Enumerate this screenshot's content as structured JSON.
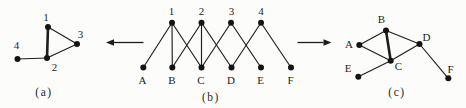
{
  "figure": {
    "width": 466,
    "height": 108,
    "background": "#fcfcfb",
    "ink": "#1e1e1e",
    "node_color": "#141414",
    "node_radius": 3,
    "edge_width": 1.15,
    "thick_edge_width": 2.6,
    "label_font_size": 11,
    "caption_font_size": 11.5,
    "caption_letter_spacing": 1.5
  },
  "graphs": [
    {
      "id": "a",
      "caption": "(a)",
      "caption_x": 44,
      "caption_y": 92,
      "nodes": [
        {
          "id": "1",
          "x": 48,
          "y": 27,
          "label": "1",
          "lx": 46,
          "ly": 17.5
        },
        {
          "id": "2",
          "x": 47,
          "y": 58,
          "label": "2",
          "lx": 54.5,
          "ly": 67
        },
        {
          "id": "3",
          "x": 77,
          "y": 44,
          "label": "3",
          "lx": 80.5,
          "ly": 34.5
        },
        {
          "id": "4",
          "x": 17.5,
          "y": 59,
          "label": "4",
          "lx": 16.5,
          "ly": 45
        }
      ],
      "edges": [
        {
          "source": "1",
          "target": "2",
          "thick": true
        },
        {
          "source": "1",
          "target": "3",
          "thick": false
        },
        {
          "source": "2",
          "target": "3",
          "thick": false
        },
        {
          "source": "2",
          "target": "4",
          "thick": false
        }
      ]
    },
    {
      "id": "b",
      "caption": "(b)",
      "caption_x": 211,
      "caption_y": 97,
      "nodes": [
        {
          "id": "1",
          "x": 172,
          "y": 22.7,
          "label": "1",
          "lx": 171.5,
          "ly": 11.5
        },
        {
          "id": "2",
          "x": 201.5,
          "y": 22.7,
          "label": "2",
          "lx": 201.5,
          "ly": 11.5
        },
        {
          "id": "3",
          "x": 231,
          "y": 22.7,
          "label": "3",
          "lx": 231.5,
          "ly": 11.5
        },
        {
          "id": "4",
          "x": 261,
          "y": 22.7,
          "label": "4",
          "lx": 261,
          "ly": 11.5
        },
        {
          "id": "A",
          "x": 143.3,
          "y": 67.5,
          "label": "A",
          "lx": 142.5,
          "ly": 80.5
        },
        {
          "id": "B",
          "x": 172.3,
          "y": 67.5,
          "label": "B",
          "lx": 172,
          "ly": 80.5
        },
        {
          "id": "C",
          "x": 201.5,
          "y": 67.5,
          "label": "C",
          "lx": 201,
          "ly": 80.5
        },
        {
          "id": "D",
          "x": 231.5,
          "y": 67.5,
          "label": "D",
          "lx": 231,
          "ly": 80.5
        },
        {
          "id": "E",
          "x": 261,
          "y": 67.5,
          "label": "E",
          "lx": 260.5,
          "ly": 80.5
        },
        {
          "id": "F",
          "x": 291,
          "y": 67.5,
          "label": "F",
          "lx": 290.5,
          "ly": 80.5
        }
      ],
      "edges": [
        {
          "source": "1",
          "target": "A",
          "thick": false
        },
        {
          "source": "1",
          "target": "B",
          "thick": false
        },
        {
          "source": "1",
          "target": "C",
          "thick": false
        },
        {
          "source": "2",
          "target": "B",
          "thick": false
        },
        {
          "source": "2",
          "target": "C",
          "thick": false
        },
        {
          "source": "2",
          "target": "D",
          "thick": false
        },
        {
          "source": "3",
          "target": "C",
          "thick": false
        },
        {
          "source": "3",
          "target": "E",
          "thick": false
        },
        {
          "source": "4",
          "target": "D",
          "thick": false
        },
        {
          "source": "4",
          "target": "F",
          "thick": false
        }
      ]
    },
    {
      "id": "c",
      "caption": "(c)",
      "caption_x": 397,
      "caption_y": 92,
      "nodes": [
        {
          "id": "A",
          "x": 359.3,
          "y": 45,
          "label": "A",
          "lx": 349,
          "ly": 44
        },
        {
          "id": "B",
          "x": 386,
          "y": 30.5,
          "label": "B",
          "lx": 381.5,
          "ly": 19.5
        },
        {
          "id": "C",
          "x": 390.7,
          "y": 60.7,
          "label": "C",
          "lx": 398.5,
          "ly": 66.5
        },
        {
          "id": "D",
          "x": 419.5,
          "y": 44,
          "label": "D",
          "lx": 426.5,
          "ly": 37.5
        },
        {
          "id": "E",
          "x": 358.3,
          "y": 76.7,
          "label": "E",
          "lx": 348,
          "ly": 68.5
        },
        {
          "id": "F",
          "x": 448.3,
          "y": 78.3,
          "label": "F",
          "lx": 450.5,
          "ly": 69.5
        }
      ],
      "edges": [
        {
          "source": "A",
          "target": "B",
          "thick": false
        },
        {
          "source": "A",
          "target": "C",
          "thick": false
        },
        {
          "source": "B",
          "target": "C",
          "thick": true
        },
        {
          "source": "B",
          "target": "D",
          "thick": false
        },
        {
          "source": "C",
          "target": "D",
          "thick": false
        },
        {
          "source": "C",
          "target": "E",
          "thick": false
        },
        {
          "source": "D",
          "target": "F",
          "thick": false
        }
      ]
    }
  ],
  "arrows": [
    {
      "name": "arrow-left",
      "tail_x": 143.5,
      "tail_y": 42.5,
      "tip_x": 106,
      "tip_y": 42.5
    },
    {
      "name": "arrow-right",
      "tail_x": 297.5,
      "tail_y": 42.5,
      "tip_x": 331.5,
      "tip_y": 42.5
    }
  ]
}
